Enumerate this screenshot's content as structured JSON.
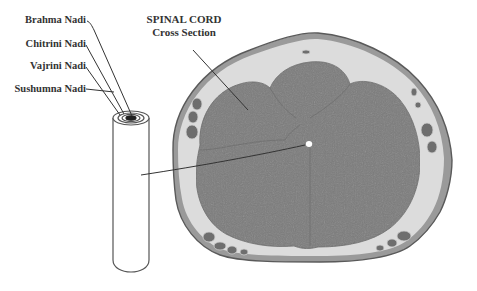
{
  "diagram": {
    "title": {
      "line1": "SPINAL CORD",
      "line2": "Cross Section"
    },
    "nadi_labels": [
      {
        "label": "Brahma Nadi",
        "ring": "innermost (central canal, filled black)"
      },
      {
        "label": "Chitrini Nadi",
        "ring": "second ring"
      },
      {
        "label": "Vajrini Nadi",
        "ring": "third ring"
      },
      {
        "label": "Sushumna Nadi",
        "ring": "outer cylinder"
      }
    ],
    "components": {
      "cylinder": "Sushumna tube (schematic cylinder with concentric rings at top)",
      "cross_section": "Histological spinal cord cross section with central canal"
    },
    "colors": {
      "background": "#ffffff",
      "text": "#333333",
      "tissue_gray": "#7a7a7a",
      "membrane_light": "#d8d8d8",
      "outline": "#555555",
      "central_canal": "#ffffff"
    }
  }
}
